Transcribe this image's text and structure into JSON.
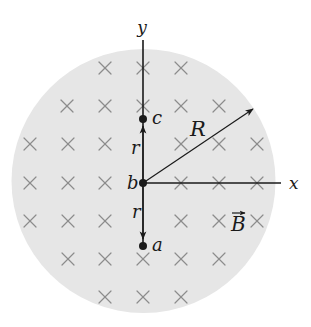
{
  "figure": {
    "width": 311,
    "height": 327,
    "background": "#ffffff"
  },
  "region": {
    "shape": "circle",
    "center": [
      143.5,
      181
    ],
    "radius": 132,
    "fill": "#e6e6e6"
  },
  "field": {
    "direction": "into-page",
    "symbol": "×",
    "color": "#8c8c8c",
    "size": 12,
    "rows": [
      {
        "y": 68,
        "xs": [
          105,
          143,
          181
        ]
      },
      {
        "y": 106,
        "xs": [
          67,
          105,
          143,
          181,
          219
        ]
      },
      {
        "y": 144,
        "xs": [
          30,
          68,
          105,
          181,
          219,
          257
        ]
      },
      {
        "y": 183,
        "xs": [
          30,
          68,
          105,
          181,
          219,
          257
        ]
      },
      {
        "y": 221,
        "xs": [
          30,
          68,
          105,
          181,
          219,
          257
        ]
      },
      {
        "y": 259,
        "xs": [
          68,
          105,
          143,
          181,
          219
        ]
      },
      {
        "y": 297,
        "xs": [
          105,
          143,
          181
        ]
      }
    ]
  },
  "axes": {
    "origin": [
      143,
      183
    ],
    "x_axis": {
      "end": [
        281,
        183
      ],
      "label": "x",
      "label_pos": [
        289,
        189
      ]
    },
    "y_axis": {
      "top": [
        143,
        40
      ],
      "bottom": [
        143,
        244
      ],
      "label": "y",
      "label_pos": [
        142,
        33
      ]
    }
  },
  "points": [
    {
      "id": "c",
      "label": "c",
      "pos": [
        143,
        119
      ],
      "label_pos": [
        152,
        124
      ]
    },
    {
      "id": "b",
      "label": "b",
      "pos": [
        143,
        183
      ],
      "label_pos": [
        127,
        189
      ]
    },
    {
      "id": "a",
      "label": "a",
      "pos": [
        143,
        246
      ],
      "label_pos": [
        152,
        251
      ]
    }
  ],
  "vectors": [
    {
      "id": "r-up",
      "label": "r",
      "from": [
        143,
        183
      ],
      "to": [
        143,
        126
      ],
      "label_pos": [
        131,
        154
      ]
    },
    {
      "id": "r-down",
      "label": "r",
      "from": [
        143,
        183
      ],
      "to": [
        143,
        239
      ],
      "label_pos": [
        132,
        218
      ]
    },
    {
      "id": "R",
      "label": "R",
      "from": [
        143,
        183
      ],
      "to": [
        253,
        109
      ],
      "label_pos": [
        190,
        136
      ]
    }
  ],
  "field_label": {
    "label": "B",
    "vector_arrow": true,
    "pos": [
      231,
      231
    ]
  },
  "colors": {
    "ink": "#1a1a1a",
    "region_fill": "#e6e6e6",
    "cross": "#8c8c8c"
  }
}
